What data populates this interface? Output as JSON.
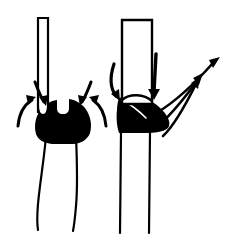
{
  "figure": {
    "type": "line-art-diagram",
    "width": 232,
    "height": 238,
    "background_color": "#ffffff",
    "ink_color": "#000000"
  },
  "panels": [
    {
      "id": "left-panel",
      "name": "narrow-tube-converging-flow",
      "description": "Narrow vertical tube entering a rounded black mass, with four arrows converging inward toward the mass, and a tapering waisted vessel below.",
      "tube": {
        "name": "narrow-tube",
        "style": "outline",
        "x_left": 38,
        "x_right": 48,
        "y_top": 18,
        "y_bottom": 110,
        "width": 10
      },
      "mass": {
        "name": "black-mass-rounded",
        "fill": "#000000",
        "shape": "rounded-blob-with-top-notch",
        "center_x": 62,
        "center_y": 122,
        "width": 58,
        "height": 42
      },
      "vessel": {
        "name": "tapering-vessel",
        "style": "outline",
        "y_top": 140,
        "y_bottom": 230,
        "top_width": 30,
        "waist_width": 16,
        "bottom_width": 26
      },
      "arrows": [
        {
          "name": "arrow-down-left",
          "direction": "down-inward",
          "from_x": 38,
          "from_y": 84,
          "to_x": 48,
          "to_y": 104
        },
        {
          "name": "arrow-down-right",
          "direction": "down-inward",
          "from_x": 88,
          "from_y": 84,
          "to_x": 78,
          "to_y": 104
        },
        {
          "name": "arrow-curve-up-left",
          "direction": "up-inward",
          "from_x": 22,
          "from_y": 124,
          "to_x": 34,
          "to_y": 100
        },
        {
          "name": "arrow-curve-up-right",
          "direction": "up-inward",
          "from_x": 100,
          "from_y": 124,
          "to_x": 90,
          "to_y": 100
        }
      ]
    },
    {
      "id": "right-panel",
      "name": "wide-tube-outward-flow",
      "description": "Wide vertical tube with an angular black wedge mass at its base, two downward arrows entering, and three long curved arrows sweeping outward up and to the right.",
      "tube": {
        "name": "wide-tube",
        "style": "outline",
        "x_left": 122,
        "x_right": 152,
        "y_top": 20,
        "y_bottom": 100,
        "width": 30
      },
      "mass": {
        "name": "black-mass-wedge",
        "fill": "#000000",
        "shape": "angular-wedge",
        "center_x": 145,
        "center_y": 115,
        "width": 52,
        "height": 40
      },
      "vessel": {
        "name": "straight-vessel",
        "style": "outline-parallel-walls",
        "x_left": 121,
        "x_right": 150,
        "y_top": 134,
        "y_bottom": 233
      },
      "arrows": [
        {
          "name": "arrow-down-curved-left",
          "direction": "down-curving",
          "from_x": 116,
          "from_y": 66,
          "to_x": 124,
          "to_y": 98
        },
        {
          "name": "arrow-down-straight-inner",
          "direction": "down",
          "from_x": 155,
          "from_y": 56,
          "to_x": 153,
          "to_y": 96
        },
        {
          "name": "arrow-out-long-upper",
          "direction": "up-right",
          "from_x": 156,
          "from_y": 112,
          "to_x": 219,
          "to_y": 58
        },
        {
          "name": "arrow-out-middle",
          "direction": "up-right",
          "from_x": 160,
          "from_y": 124,
          "to_x": 203,
          "to_y": 75
        },
        {
          "name": "arrow-out-lower",
          "direction": "up-right",
          "from_x": 164,
          "from_y": 134,
          "to_x": 200,
          "to_y": 78
        }
      ]
    }
  ]
}
